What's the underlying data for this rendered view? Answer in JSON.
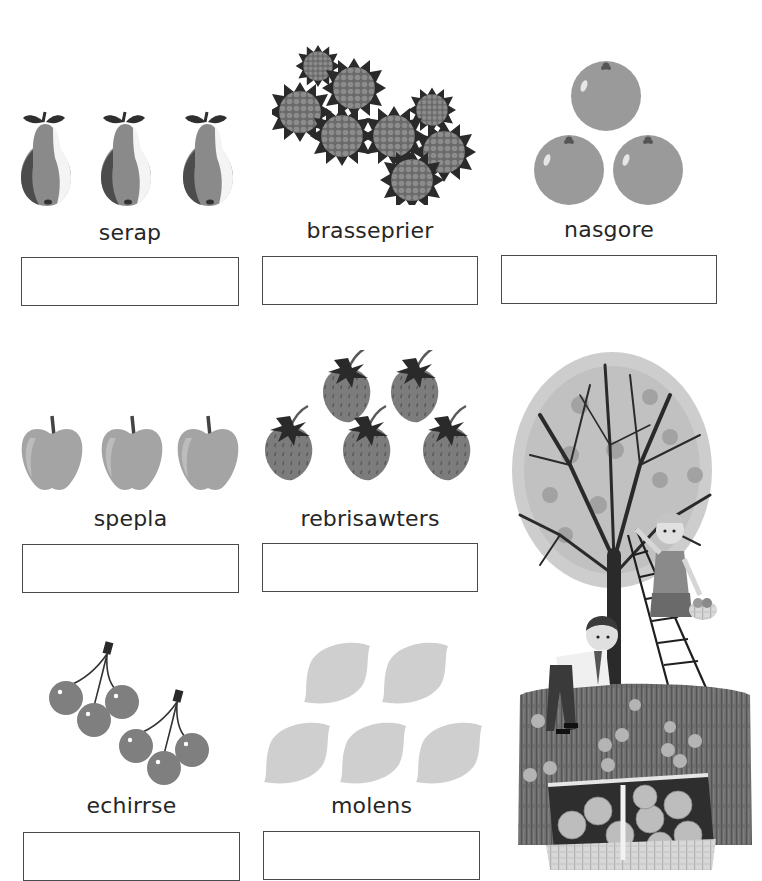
{
  "worksheet": {
    "exercises": [
      {
        "id": "pears",
        "fruit_icon": "pear-icon",
        "count": 3,
        "scrambled_word": "serap",
        "answer": ""
      },
      {
        "id": "raspberries",
        "fruit_icon": "raspberry-icon",
        "count": 8,
        "scrambled_word": "brasseprier",
        "answer": ""
      },
      {
        "id": "oranges",
        "fruit_icon": "orange-icon",
        "count": 3,
        "scrambled_word": "nasgore",
        "answer": ""
      },
      {
        "id": "apples",
        "fruit_icon": "apple-icon",
        "count": 3,
        "scrambled_word": "spepla",
        "answer": ""
      },
      {
        "id": "strawberries",
        "fruit_icon": "strawberry-icon",
        "count": 5,
        "scrambled_word": "rebrisawters",
        "answer": ""
      },
      {
        "id": "cherries",
        "fruit_icon": "cherry-icon",
        "count": 6,
        "scrambled_word": "echirrse",
        "answer": ""
      },
      {
        "id": "lemons",
        "fruit_icon": "lemon-icon",
        "count": 5,
        "scrambled_word": "molens",
        "answer": ""
      }
    ],
    "illustration": "orchard-illustration",
    "colors": {
      "text": "#262626",
      "box_border": "#4a4a4a",
      "pear": "#8a8a8a",
      "raspberry": "#7a7a7a",
      "orange": "#9a9a9a",
      "apple": "#a4a4a4",
      "strawberry": "#7c7c7c",
      "cherry": "#7f7f7f",
      "lemon": "#cfcfcf",
      "leaf": "#2f2f2f"
    }
  }
}
